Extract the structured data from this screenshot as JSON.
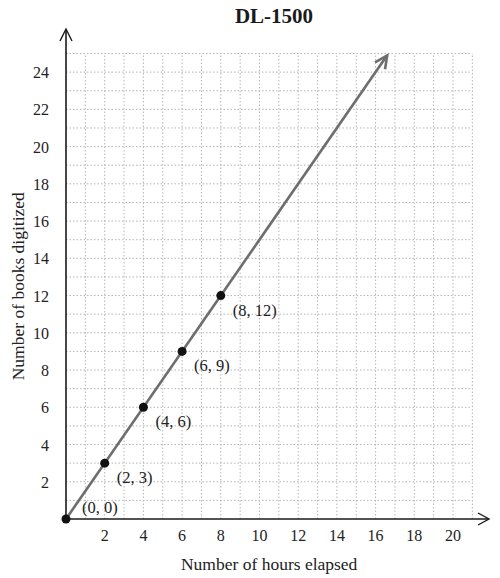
{
  "chart_data": {
    "type": "line",
    "title": "DL-1500",
    "xlabel": "Number of hours elapsed",
    "ylabel": "Number of books digitized",
    "xlim": [
      0,
      21
    ],
    "ylim": [
      0,
      25
    ],
    "x_ticks": [
      2,
      4,
      6,
      8,
      10,
      12,
      14,
      16,
      18,
      20
    ],
    "y_ticks": [
      2,
      4,
      6,
      8,
      10,
      12,
      14,
      16,
      18,
      20,
      22,
      24
    ],
    "grid": true,
    "grid_step": 1,
    "legend": null,
    "series": [
      {
        "name": "DL-1500",
        "x": [
          0,
          2,
          4,
          6,
          8
        ],
        "y": [
          0,
          3,
          6,
          9,
          12
        ],
        "line_extends_to": [
          16.6,
          24.9
        ],
        "arrow_at_end": true,
        "color": "#6e6e6e",
        "marker_color": "#111111"
      }
    ],
    "annotations": [
      "(0, 0)",
      "(2, 3)",
      "(4, 6)",
      "(6, 9)",
      "(8, 12)"
    ]
  },
  "colors": {
    "grid": "#b5b5b5",
    "axis": "#1a1a1a",
    "line": "#6e6e6e",
    "point": "#111111"
  }
}
